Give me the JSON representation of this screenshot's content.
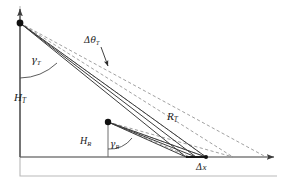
{
  "figure": {
    "width": 286,
    "height": 183,
    "background": "#ffffff",
    "line_color": "#3c3c3c",
    "dash_color": "#8c8c8c",
    "frame_color": "#9a9a9a",
    "text_color": "#1a1a1a"
  },
  "labels": {
    "transmitter_height": {
      "base": "H",
      "sub": "T"
    },
    "receiver_height": {
      "base": "H",
      "sub": "R"
    },
    "transmitter_angle": {
      "base": "γ",
      "sub": "T"
    },
    "receiver_angle": {
      "base": "γ",
      "sub": "R"
    },
    "beam_spread": {
      "base": "Δθ",
      "sub": "T"
    },
    "transmitter_range": {
      "base": "R",
      "sub": "T"
    },
    "ground_offset": {
      "base": "Δ",
      "sub2": "x"
    }
  },
  "geometry": {
    "transmitter_node": {
      "x": 20,
      "y": 23
    },
    "receiver_node": {
      "x": 108,
      "y": 122
    },
    "ground_target": {
      "x": 206,
      "y": 157
    },
    "ground_line_y": 157,
    "vertical_axis_x": 20,
    "axis_arrow_right": {
      "x": 277,
      "y": 157
    },
    "axis_arrow_top": {
      "x": 20,
      "y": 6
    }
  }
}
